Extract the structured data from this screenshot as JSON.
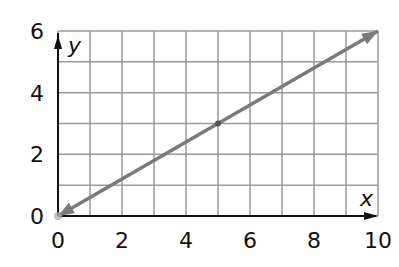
{
  "chart_data": {
    "type": "line",
    "title": "",
    "xlabel": "x",
    "ylabel": "y",
    "xlim": [
      0,
      10
    ],
    "ylim": [
      0,
      6
    ],
    "x_ticks": [
      "0",
      "2",
      "4",
      "6",
      "8",
      "10"
    ],
    "y_ticks": [
      "0",
      "2",
      "4",
      "6"
    ],
    "grid": true,
    "grid_step_x": 1,
    "grid_step_y": 1,
    "legend": null,
    "series": [
      {
        "name": "line",
        "x": [
          0,
          5,
          10
        ],
        "y": [
          0,
          3,
          6
        ],
        "equation": "y = 0.6x",
        "arrows_both_ends": true,
        "marked_point": [
          5,
          3
        ],
        "color": "#7a7a7a"
      }
    ]
  },
  "colors": {
    "grid": "#9a9a9a",
    "axis": "#111111",
    "line": "#7a7a7a",
    "background": "#ffffff"
  }
}
